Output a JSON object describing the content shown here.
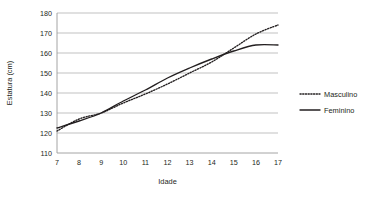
{
  "chart_data": {
    "type": "line",
    "title": "",
    "xlabel": "Idade",
    "ylabel": "Estatura (cm)",
    "x": [
      7,
      8,
      9,
      10,
      11,
      12,
      13,
      14,
      15,
      16,
      17
    ],
    "xlim": [
      7,
      17
    ],
    "ylim": [
      110,
      180
    ],
    "yticks": [
      110,
      120,
      130,
      140,
      150,
      160,
      170,
      180
    ],
    "xticks": [
      "7",
      "8",
      "9",
      "10",
      "11",
      "12",
      "13",
      "14",
      "15",
      "16",
      "17"
    ],
    "ytick_labels": [
      "110",
      "120",
      "130",
      "140",
      "150",
      "160",
      "170",
      "180"
    ],
    "grid": "horizontal",
    "legend_position": "right",
    "series": [
      {
        "name": "Masculino",
        "style": "dotted",
        "color": "#231f20",
        "values": [
          121.0,
          127.0,
          130.0,
          135.0,
          139.5,
          144.5,
          150.0,
          155.5,
          162.5,
          169.5,
          174.0
        ]
      },
      {
        "name": "Feminino",
        "style": "solid",
        "color": "#231f20",
        "values": [
          122.5,
          126.0,
          130.0,
          136.0,
          141.5,
          147.5,
          152.5,
          157.0,
          161.0,
          164.0,
          164.0
        ]
      }
    ]
  },
  "legend": {
    "items": [
      {
        "label": "Masculino",
        "style": "dotted"
      },
      {
        "label": "Feminino",
        "style": "solid"
      }
    ]
  },
  "colors": {
    "ink": "#231f20",
    "grid": "#a6a6a6",
    "background": "#ffffff"
  }
}
